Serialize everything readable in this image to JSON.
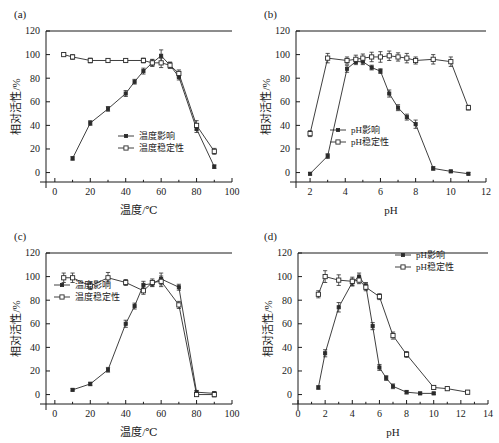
{
  "figure": {
    "panels": [
      "a",
      "b",
      "c",
      "d"
    ]
  },
  "labels": {
    "panel_a": "(a)",
    "panel_b": "(b)",
    "panel_c": "(c)",
    "panel_d": "(d)",
    "y_axis": "相对活性/%",
    "x_axis_temp": "温度/℃",
    "x_axis_ph": "pH",
    "legend_temp_effect": "温度影响",
    "legend_temp_stability": "温度稳定性",
    "legend_ph_effect": "pH影响",
    "legend_ph_stability": "pH稳定性"
  },
  "colors": {
    "line": "#2a2a2a",
    "marker_filled": "#2a2a2a",
    "marker_open": "#ffffff",
    "axis": "#1a1a1a",
    "background": "#ffffff"
  },
  "chart_data": [
    {
      "id": "a",
      "type": "line",
      "title": "(a)",
      "xlabel": "温度/℃",
      "ylabel": "相对活性/%",
      "xlim": [
        -5,
        100
      ],
      "ylim": [
        -8,
        120
      ],
      "xticks": [
        0,
        20,
        40,
        60,
        80,
        100
      ],
      "yticks": [
        0,
        20,
        40,
        60,
        80,
        100,
        120
      ],
      "grid": false,
      "legend_position": "center-bottom",
      "series": [
        {
          "name": "温度影响",
          "marker": "filled-square",
          "x": [
            10,
            20,
            30,
            40,
            45,
            50,
            55,
            60,
            65,
            70,
            80,
            90
          ],
          "values": [
            12,
            42,
            54,
            67,
            77,
            86,
            93,
            99,
            91,
            81,
            37,
            5
          ],
          "errors": [
            1.5,
            2,
            2,
            2.5,
            2,
            2.5,
            3,
            5,
            2.5,
            2.5,
            3,
            1.5
          ]
        },
        {
          "name": "温度稳定性",
          "marker": "open-square",
          "x": [
            5,
            10,
            20,
            30,
            40,
            50,
            55,
            60,
            65,
            70,
            80,
            90
          ],
          "values": [
            100,
            98,
            95,
            95,
            95,
            95,
            93,
            93,
            91,
            84,
            40,
            18
          ],
          "errors": [
            1.5,
            2,
            2,
            1.5,
            1.5,
            2,
            2.5,
            4,
            2.5,
            3,
            4,
            2.5
          ]
        }
      ]
    },
    {
      "id": "b",
      "type": "line",
      "title": "(b)",
      "xlabel": "pH",
      "ylabel": "相对活性/%",
      "xlim": [
        1.2,
        12
      ],
      "ylim": [
        -8,
        120
      ],
      "xticks": [
        2,
        4,
        6,
        8,
        10,
        12
      ],
      "yticks": [
        0,
        20,
        40,
        60,
        80,
        100,
        120
      ],
      "grid": false,
      "legend_position": "center-left",
      "series": [
        {
          "name": "pH影响",
          "marker": "filled-square",
          "x": [
            2,
            3,
            4.1,
            4.6,
            5,
            5.5,
            6,
            6.5,
            7,
            7.5,
            8,
            9,
            10,
            11
          ],
          "values": [
            -1,
            14,
            88,
            94,
            94,
            89,
            86,
            67,
            55,
            47,
            41,
            3.5,
            1,
            -1
          ],
          "errors": [
            1,
            2,
            3,
            2.5,
            2.5,
            2,
            2,
            3,
            2.5,
            2.5,
            3.5,
            1.5,
            1,
            1
          ]
        },
        {
          "name": "pH稳定性",
          "marker": "open-square",
          "x": [
            2,
            3,
            4.1,
            4.6,
            5,
            5.5,
            6,
            6.5,
            7,
            7.5,
            8,
            9,
            10,
            11
          ],
          "values": [
            33,
            97,
            95,
            96,
            97,
            98,
            98,
            99,
            98,
            97,
            95,
            96,
            94,
            55
          ],
          "errors": [
            2.5,
            4,
            3,
            3.5,
            3.5,
            4,
            4.5,
            4,
            3.5,
            4,
            3,
            4,
            4,
            2
          ]
        }
      ]
    },
    {
      "id": "c",
      "type": "line",
      "title": "(c)",
      "xlabel": "温度/℃",
      "ylabel": "相对活性/%",
      "xlim": [
        -5,
        100
      ],
      "ylim": [
        -8,
        120
      ],
      "xticks": [
        0,
        20,
        40,
        60,
        80,
        100
      ],
      "yticks": [
        0,
        20,
        40,
        60,
        80,
        100,
        120
      ],
      "grid": false,
      "legend_position": "upper-left",
      "series": [
        {
          "name": "温度影响",
          "marker": "filled-square",
          "x": [
            10,
            20,
            30,
            40,
            45,
            50,
            55,
            60,
            70,
            80,
            90
          ],
          "values": [
            4,
            9,
            21,
            60,
            75,
            93,
            94,
            98,
            91,
            2,
            1
          ],
          "errors": [
            1,
            1.5,
            2,
            3,
            2.5,
            3,
            2.5,
            5,
            2.5,
            1.5,
            1.5
          ]
        },
        {
          "name": "温度稳定性",
          "marker": "open-square",
          "x": [
            5,
            10,
            20,
            30,
            40,
            50,
            55,
            60,
            70,
            80,
            90
          ],
          "values": [
            99,
            99,
            92,
            99,
            95,
            88,
            95,
            96,
            76,
            0,
            0
          ],
          "errors": [
            4,
            4,
            3,
            4.5,
            2.5,
            3,
            3,
            4.5,
            3,
            1.5,
            2
          ]
        }
      ]
    },
    {
      "id": "d",
      "type": "line",
      "title": "(d)",
      "xlabel": "pH",
      "ylabel": "相对活性/%",
      "xlim": [
        0,
        14
      ],
      "ylim": [
        -8,
        120
      ],
      "xticks": [
        0,
        2,
        4,
        6,
        8,
        10,
        12,
        14
      ],
      "yticks": [
        0,
        20,
        40,
        60,
        80,
        100,
        120
      ],
      "grid": false,
      "legend_position": "upper-right",
      "series": [
        {
          "name": "pH影响",
          "marker": "filled-square",
          "x": [
            1.5,
            2,
            3,
            4,
            4.5,
            5,
            5.5,
            6,
            6.5,
            7,
            8,
            9,
            10
          ],
          "values": [
            6,
            35,
            74,
            95,
            100,
            92,
            58,
            23,
            14,
            7,
            2,
            1,
            1
          ],
          "errors": [
            1.5,
            3,
            4,
            3,
            3,
            3,
            3,
            2.5,
            2,
            2,
            1.5,
            1,
            1
          ]
        },
        {
          "name": "pH稳定性",
          "marker": "open-square",
          "x": [
            1.5,
            2,
            3,
            4,
            4.5,
            5,
            6,
            7,
            8,
            10,
            11,
            12.5
          ],
          "values": [
            85,
            100,
            97,
            96,
            97,
            91,
            83,
            50,
            34,
            6,
            5,
            2
          ],
          "errors": [
            3,
            5,
            4.5,
            3.5,
            3,
            3,
            2.5,
            3,
            2.5,
            1.5,
            1.5,
            1.5
          ]
        }
      ]
    }
  ]
}
